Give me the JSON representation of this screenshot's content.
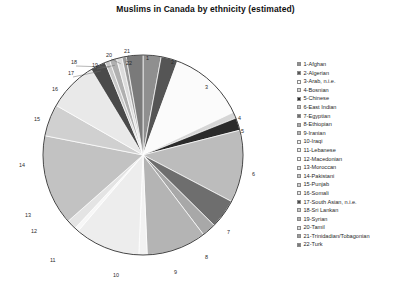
{
  "chart_data": {
    "type": "pie",
    "title": "Muslims in Canada by ethnicity (estimated)",
    "xlabel": "",
    "ylabel": "",
    "legend_position": "right",
    "grid": false,
    "start_angle_deg": 0,
    "direction": "clockwise",
    "categories": [
      "1-Afghan",
      "2-Algerian",
      "3-Arab, n.i.e.",
      "4-Bosnian",
      "5-Chinese",
      "6-East Indian",
      "7-Egyptian",
      "8-Ethiopian",
      "9-Iranian",
      "10-Iraqi",
      "11-Lebanese",
      "12-Macedonian",
      "13-Moroccan",
      "14-Pakistani",
      "15-Punjab",
      "16-Somali",
      "17-South Asian, n.i.e.",
      "18-Sri Lankan",
      "19-Syrian",
      "20-Tamil",
      "21-Trinidadian/Tobagonian",
      "22-Turk"
    ],
    "values": [
      2.6,
      2.4,
      11.0,
      0.9,
      1.8,
      10.4,
      4.2,
      2.0,
      8.6,
      1.2,
      9.4,
      0.6,
      1.4,
      13.0,
      4.6,
      7.2,
      2.2,
      0.7,
      1.0,
      0.8,
      0.6,
      2.4
    ],
    "colors": [
      "#8f8f8f",
      "#555555",
      "#fbfbfb",
      "#d6d6d6",
      "#2b2b2b",
      "#bcbcbc",
      "#6e6e6e",
      "#a8a8a8",
      "#b4b4b4",
      "#f2f2f2",
      "#ededed",
      "#f7f7f7",
      "#e4e4e4",
      "#c2c2c2",
      "#d0d0d0",
      "#e9e9e9",
      "#4a4a4a",
      "#c8c8c8",
      "#b0b0b0",
      "#dcdcdc",
      "#9a9a9a",
      "#7a7a7a"
    ],
    "slice_labels": [
      {
        "n": "1",
        "x": 146,
        "y": 39,
        "leader": false
      },
      {
        "n": "2",
        "x": 171,
        "y": 43,
        "leader": false
      },
      {
        "n": "3",
        "x": 205,
        "y": 68,
        "leader": false
      },
      {
        "n": "4",
        "x": 238,
        "y": 99,
        "leader": false
      },
      {
        "n": "5",
        "x": 241,
        "y": 112,
        "leader": false
      },
      {
        "n": "6",
        "x": 252,
        "y": 155,
        "leader": false
      },
      {
        "n": "7",
        "x": 227,
        "y": 213,
        "leader": false
      },
      {
        "n": "8",
        "x": 205,
        "y": 238,
        "leader": false
      },
      {
        "n": "9",
        "x": 174,
        "y": 253,
        "leader": false
      },
      {
        "n": "10",
        "x": 113,
        "y": 256,
        "leader": false
      },
      {
        "n": "11",
        "x": 50,
        "y": 241,
        "leader": false
      },
      {
        "n": "12",
        "x": 31,
        "y": 212,
        "leader": false
      },
      {
        "n": "13",
        "x": 25,
        "y": 196,
        "leader": false
      },
      {
        "n": "14",
        "x": 19,
        "y": 146,
        "leader": false
      },
      {
        "n": "15",
        "x": 34,
        "y": 100,
        "leader": false
      },
      {
        "n": "16",
        "x": 52,
        "y": 70,
        "leader": false
      },
      {
        "n": "17",
        "x": 68,
        "y": 54,
        "leader": true
      },
      {
        "n": "18",
        "x": 71,
        "y": 43,
        "leader": true
      },
      {
        "n": "19",
        "x": 92,
        "y": 46,
        "leader": true
      },
      {
        "n": "20",
        "x": 106,
        "y": 36,
        "leader": true
      },
      {
        "n": "21",
        "x": 124,
        "y": 32,
        "leader": true
      },
      {
        "n": "22",
        "x": 126,
        "y": 44,
        "leader": false
      }
    ]
  },
  "legend": {
    "items": [
      {
        "label": "1-Afghan"
      },
      {
        "label": "2-Algerian"
      },
      {
        "label": "3-Arab, n.i.e."
      },
      {
        "label": "4-Bosnian"
      },
      {
        "label": "5-Chinese"
      },
      {
        "label": "6-East Indian"
      },
      {
        "label": "7-Egyptian"
      },
      {
        "label": "8-Ethiopian"
      },
      {
        "label": "9-Iranian"
      },
      {
        "label": "10-Iraqi"
      },
      {
        "label": "11-Lebanese"
      },
      {
        "label": "12-Macedonian"
      },
      {
        "label": "13-Moroccan"
      },
      {
        "label": "14-Pakistani"
      },
      {
        "label": "15-Punjab"
      },
      {
        "label": "16-Somali"
      },
      {
        "label": "17-South Asian, n.i.e."
      },
      {
        "label": "18-Sri Lankan"
      },
      {
        "label": "19-Syrian"
      },
      {
        "label": "20-Tamil"
      },
      {
        "label": "21-Trinidadian/Tobagonian"
      },
      {
        "label": "22-Turk"
      }
    ]
  }
}
